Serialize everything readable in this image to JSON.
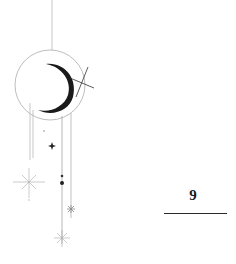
{
  "illustration": {
    "name": "celestial-moon-ornament",
    "colors": {
      "line": "#9a9a9a",
      "ink": "#1a1a1a",
      "background": "#ffffff"
    }
  },
  "page": {
    "number": "9"
  }
}
